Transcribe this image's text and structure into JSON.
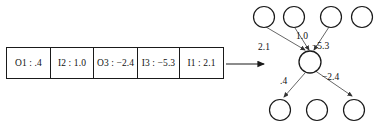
{
  "figure": {
    "array": {
      "cells": [
        {
          "key": "O1",
          "value": ".4",
          "text": "O1 : .4"
        },
        {
          "key": "I2",
          "value": "1.0",
          "text": "I2 : 1.0"
        },
        {
          "key": "O3",
          "value": "−2.4",
          "text": "O3 : −2.4"
        },
        {
          "key": "I3",
          "value": "−5.3",
          "text": "I3 : −5.3"
        },
        {
          "key": "I1",
          "value": "2.1",
          "text": "I1 : 2.1"
        }
      ]
    },
    "arrow": {
      "direction": "right"
    },
    "graph": {
      "top_nodes_count": 4,
      "bottom_nodes_count": 3,
      "center_node_count": 1,
      "incoming_edge_labels": [
        "2.1",
        "1.0",
        "−5.3"
      ],
      "outgoing_edge_labels": [
        ".4",
        "−2.4"
      ]
    },
    "colors": {
      "stroke": "#1a1a1a",
      "text": "#111111",
      "edge": "#555555",
      "background": "#ffffff"
    }
  }
}
